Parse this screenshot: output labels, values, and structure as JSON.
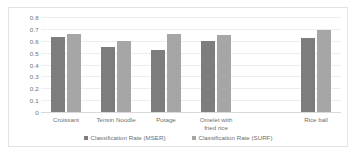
{
  "chart_data": {
    "type": "bar",
    "title": "",
    "xlabel": "",
    "ylabel": "",
    "ylim": [
      0,
      0.8
    ],
    "grid": true,
    "legend_position": "bottom",
    "categories": [
      "Croissant",
      "Tensin Noodle",
      "Potage",
      "Omelet with\nfried rice",
      "",
      "Rice ball"
    ],
    "y_ticks": [
      "0.8",
      "0.7",
      "0.6",
      "0.5",
      "0.4",
      "0.3",
      "0.2",
      "0.1",
      "0"
    ],
    "y_tick_values": [
      0.8,
      0.7,
      0.6,
      0.5,
      0.4,
      0.3,
      0.2,
      0.1,
      0
    ],
    "series": [
      {
        "name": "Classification Rate (MSER)",
        "color": "#7d7d7d",
        "values": [
          0.63,
          0.55,
          0.52,
          0.6,
          null,
          0.62
        ]
      },
      {
        "name": "Classification Rate (SURF)",
        "color": "#a6a6a6",
        "values": [
          0.66,
          0.6,
          0.66,
          0.65,
          null,
          0.69
        ]
      }
    ]
  }
}
